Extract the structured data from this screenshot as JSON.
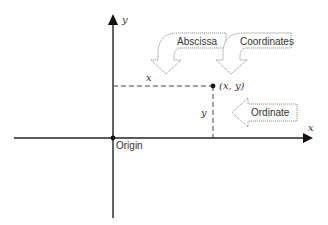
{
  "diagram": {
    "axes": {
      "x_label": "x",
      "y_label": "y"
    },
    "point": {
      "label": "(x, y)",
      "x_segment_label": "x",
      "y_segment_label": "y"
    },
    "origin": {
      "label": "Origin"
    },
    "callouts": [
      {
        "label": "Abscissa",
        "direction": "down",
        "points_to": "x"
      },
      {
        "label": "Coordinates",
        "direction": "down",
        "points_to": "(x, y)"
      },
      {
        "label": "Ordinate",
        "direction": "left",
        "points_to": "y"
      }
    ],
    "colors": {
      "axis": "#222222",
      "dashed": "#444444",
      "callout_outline": "#888888",
      "text": "#333333"
    }
  }
}
